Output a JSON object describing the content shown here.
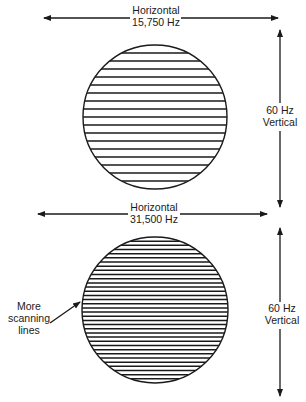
{
  "diagram": {
    "colors": {
      "stroke": "#1a1a1a",
      "background": "#ffffff"
    },
    "top": {
      "horizontal_label": "Horizontal",
      "horizontal_freq": "15,750 Hz",
      "vertical_freq": "60 Hz",
      "vertical_label": "Vertical",
      "scan_line_count": 17
    },
    "bottom": {
      "horizontal_label": "Horizontal",
      "horizontal_freq": "31,500 Hz",
      "vertical_freq": "60 Hz",
      "vertical_label": "Vertical",
      "scan_line_count": 34,
      "callout_line1": "More",
      "callout_line2": "scanning",
      "callout_line3": "lines"
    }
  }
}
